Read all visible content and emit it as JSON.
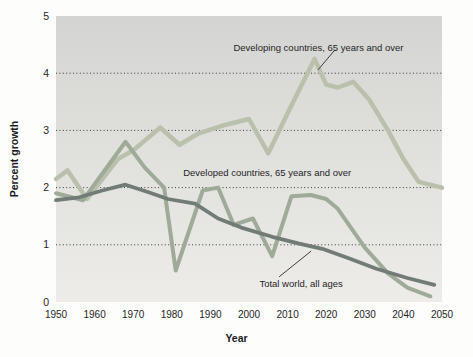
{
  "figure": {
    "y_axis_title": "Percent growth",
    "x_axis_title": "Year"
  },
  "chart_data": {
    "type": "line",
    "title": "",
    "xlabel": "Year",
    "ylabel": "Percent growth",
    "xlim": [
      1950,
      2050
    ],
    "ylim": [
      0,
      5
    ],
    "x_ticks": [
      1950,
      1960,
      1970,
      1980,
      1990,
      2000,
      2010,
      2020,
      2030,
      2040,
      2050
    ],
    "y_ticks": [
      0,
      1,
      2,
      3,
      4,
      5
    ],
    "grid": "horizontal dotted black lines at y = 1, 2, 3, 4",
    "legend_position": "inline text annotations on plot",
    "plot_background": {
      "gradient_top": "#d4d5d2",
      "gradient_bottom": "#edece8"
    },
    "gridline_color": "#3a3a3a",
    "series": [
      {
        "name": "Developing countries, 65 years and over",
        "color": "#b9c1ad",
        "stroke_width": 4.5,
        "points": [
          [
            1950,
            2.15
          ],
          [
            1953,
            2.3
          ],
          [
            1958,
            1.8
          ],
          [
            1966,
            2.5
          ],
          [
            1970,
            2.65
          ],
          [
            1977,
            3.05
          ],
          [
            1982,
            2.75
          ],
          [
            1987,
            2.95
          ],
          [
            1994,
            3.1
          ],
          [
            2000,
            3.2
          ],
          [
            2005,
            2.6
          ],
          [
            2010,
            3.3
          ],
          [
            2017,
            4.25
          ],
          [
            2020,
            3.8
          ],
          [
            2023,
            3.75
          ],
          [
            2027,
            3.85
          ],
          [
            2031,
            3.55
          ],
          [
            2036,
            3.0
          ],
          [
            2040,
            2.5
          ],
          [
            2044,
            2.1
          ],
          [
            2050,
            2.0
          ]
        ]
      },
      {
        "name": "Developed countries, 65 years and over",
        "color": "#9fab99",
        "stroke_width": 4,
        "points": [
          [
            1950,
            1.9
          ],
          [
            1957,
            1.78
          ],
          [
            1968,
            2.8
          ],
          [
            1973,
            2.35
          ],
          [
            1978,
            2.0
          ],
          [
            1981,
            0.55
          ],
          [
            1988,
            1.95
          ],
          [
            1992,
            2.0
          ],
          [
            1996,
            1.35
          ],
          [
            2001,
            1.46
          ],
          [
            2006,
            0.8
          ],
          [
            2011,
            1.85
          ],
          [
            2016,
            1.87
          ],
          [
            2020,
            1.8
          ],
          [
            2023,
            1.63
          ],
          [
            2030,
            0.95
          ],
          [
            2036,
            0.5
          ],
          [
            2041,
            0.25
          ],
          [
            2047,
            0.1
          ]
        ]
      },
      {
        "name": "Total world, all ages",
        "color": "#727c76",
        "stroke_width": 3.8,
        "points": [
          [
            1950,
            1.78
          ],
          [
            1956,
            1.83
          ],
          [
            1962,
            1.95
          ],
          [
            1968,
            2.05
          ],
          [
            1974,
            1.92
          ],
          [
            1979,
            1.8
          ],
          [
            1986,
            1.72
          ],
          [
            1992,
            1.46
          ],
          [
            1998,
            1.3
          ],
          [
            2006,
            1.14
          ],
          [
            2013,
            1.02
          ],
          [
            2019,
            0.93
          ],
          [
            2026,
            0.76
          ],
          [
            2033,
            0.58
          ],
          [
            2041,
            0.42
          ],
          [
            2048,
            0.3
          ]
        ]
      }
    ],
    "annotations": [
      {
        "text": "Developing countries, 65 years and over",
        "x": 2018,
        "y": 4.46,
        "callout": [
          [
            2022.3,
            4.41
          ],
          [
            2017.9,
            4.06
          ]
        ]
      },
      {
        "text": "Developed countries, 65 years and over",
        "x": 2004.7,
        "y": 2.27,
        "callout": null
      },
      {
        "text": "Total world, all ages",
        "x": 2013.5,
        "y": 0.33,
        "callout": [
          [
            2007.8,
            0.44
          ],
          [
            2016.1,
            0.89
          ]
        ]
      }
    ]
  }
}
